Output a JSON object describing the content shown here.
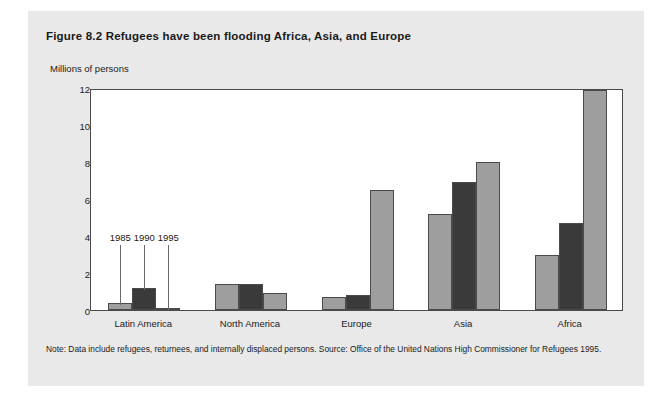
{
  "figure": {
    "title": "Figure 8.2  Refugees have been flooding Africa, Asia, and Europe",
    "note": "Note: Data include refugees, returnees, and internally displaced persons. Source: Office of the United Nations High Commissioner for Refugees 1995."
  },
  "colors": {
    "series_1985": "#9e9e9e",
    "series_1990": "#3a3a3a",
    "series_1995": "#9e9e9e",
    "plot_background": "#ffffff",
    "panel_background": "#e9e9e9",
    "rule": "#000000",
    "axis": "#4a4a4a"
  },
  "annotations": [
    {
      "label": "1985",
      "series": "1985"
    },
    {
      "label": "1990",
      "series": "1990"
    },
    {
      "label": "1995",
      "series": "1995"
    }
  ],
  "chart_data": {
    "type": "bar",
    "title": "Figure 8.2  Refugees have been flooding Africa, Asia, and Europe",
    "subtitle": "",
    "xlabel": "",
    "ylabel": "Millions of persons",
    "ylim": [
      0,
      12
    ],
    "yticks": [
      0,
      2,
      4,
      6,
      8,
      10,
      12
    ],
    "ytick_labels": [
      "0",
      "2",
      "4",
      "6",
      "8",
      "10",
      "12"
    ],
    "grid": false,
    "legend_position": "inline-annotations",
    "categories": [
      "Latin America",
      "North America",
      "Europe",
      "Asia",
      "Africa"
    ],
    "series": [
      {
        "name": "1985",
        "values": [
          0.4,
          1.4,
          0.7,
          5.2,
          3.0
        ]
      },
      {
        "name": "1990",
        "values": [
          1.2,
          1.4,
          0.8,
          6.9,
          4.7
        ]
      },
      {
        "name": "1995",
        "values": [
          0.1,
          0.9,
          6.5,
          8.0,
          11.9
        ]
      }
    ],
    "annotations": [
      "1985",
      "1990",
      "1995"
    ],
    "note": "Note: Data include refugees, returnees, and internally displaced persons. Source: Office of the United Nations High Commissioner for Refugees 1995."
  }
}
